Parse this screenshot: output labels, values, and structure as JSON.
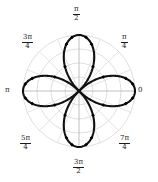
{
  "figure": {
    "kind": "polar-plot",
    "background_color": "#ffffff",
    "curve_color": "#111111",
    "marker_color": "#000000",
    "grid_color": "#c9c9c9",
    "axis_color": "#b0b0b0",
    "label_color": "#1a1a1a"
  },
  "labels": {
    "angle_0": "0",
    "angle_pi_4_num": "π",
    "angle_pi_4_den": "4",
    "angle_pi_2_num": "π",
    "angle_pi_2_den": "2",
    "angle_3pi_4_num": "3π",
    "angle_3pi_4_den": "4",
    "angle_pi": "π",
    "angle_5pi_4_num": "5π",
    "angle_5pi_4_den": "4",
    "angle_3pi_2_num": "3π",
    "angle_3pi_2_den": "2",
    "angle_7pi_4_num": "7π",
    "angle_7pi_4_den": "4"
  },
  "chart_data": {
    "type": "line",
    "coordinate_system": "polar",
    "title": "",
    "xlabel": "",
    "ylabel": "",
    "grid": true,
    "legend": null,
    "theta_tick_labels": [
      "0",
      "π/4",
      "π/2",
      "3π/4",
      "π",
      "5π/4",
      "3π/2",
      "7π/4"
    ],
    "theta_ticks_rad": [
      0,
      0.7853981634,
      1.5707963268,
      2.3561944902,
      3.1415926536,
      3.926990817,
      4.7123889804,
      5.4977871438
    ],
    "radial_grid_circles": [
      0.25,
      0.5,
      0.75,
      1.0
    ],
    "radial_spokes_count": 16,
    "rlim": [
      0,
      1
    ],
    "series": [
      {
        "name": "four-petal rose",
        "equation": "r = cos(2θ)",
        "petal_count": 4,
        "petal_axis_angles_rad": [
          0,
          1.5707963268,
          3.1415926536,
          4.7123889804
        ],
        "max_radius": 1.0,
        "marker": "diamond",
        "markers_per_petal": 6,
        "marker_theta_offsets_rad": [
          -0.5235987756,
          -0.2617993878,
          -0.1308996939,
          0.1308996939,
          0.2617993878,
          0.5235987756
        ]
      }
    ]
  }
}
